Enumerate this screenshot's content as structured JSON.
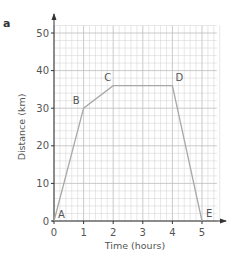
{
  "panel_label": "a",
  "chart_data": {
    "type": "line",
    "title": "",
    "xlabel": "Time (hours)",
    "ylabel": "Distance (km)",
    "x_ticks": [
      0,
      1,
      2,
      3,
      4,
      5
    ],
    "y_ticks": [
      0,
      10,
      20,
      30,
      40,
      50
    ],
    "xlim": [
      0,
      5.5
    ],
    "ylim": [
      0,
      52
    ],
    "grid": true,
    "grid_minor_x": 0.2,
    "grid_minor_y": 2,
    "legend": null,
    "series": [
      {
        "name": "journey",
        "points": [
          {
            "label": "A",
            "x": 0,
            "y": 0
          },
          {
            "label": "B",
            "x": 1,
            "y": 30
          },
          {
            "label": "C",
            "x": 2,
            "y": 36
          },
          {
            "label": "D",
            "x": 4,
            "y": 36
          },
          {
            "label": "E",
            "x": 5,
            "y": 0
          }
        ]
      }
    ],
    "colors": {
      "grid": "#d0d0d0",
      "line": "#a8a8a8",
      "axis": "#333333"
    }
  }
}
